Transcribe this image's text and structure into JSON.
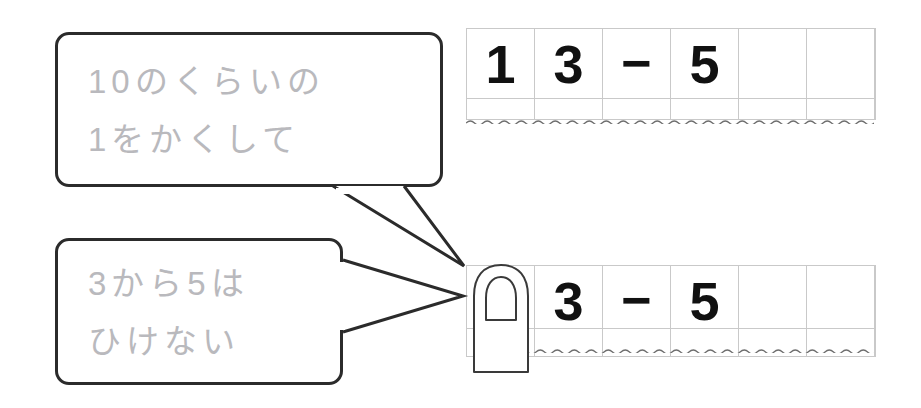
{
  "page": {
    "background_color": "#ffffff"
  },
  "colors": {
    "bubble_border": "#2b2b2b",
    "bubble_text": "#b9b9bd",
    "grid_line": "#c9c9c9",
    "digit": "#111111",
    "finger_outline": "#3a3a3a",
    "wave_line": "#6e6e6e"
  },
  "bubbles": [
    {
      "id": "bubble-one",
      "line1": "10のくらいの",
      "line2": "1をかくして",
      "tail_target": "top-of-bottom-grid"
    },
    {
      "id": "bubble-two",
      "line1": "3から5は",
      "line2": "ひけない",
      "tail_target": "finger"
    }
  ],
  "grids": [
    {
      "id": "grid-top",
      "label": "problem-row-original",
      "cells": [
        "1",
        "3",
        "−",
        "5",
        "",
        ""
      ],
      "cell_count": 6,
      "has_divider": true,
      "has_wave": true
    },
    {
      "id": "grid-bottom",
      "label": "problem-row-covered",
      "cells": [
        "",
        "3",
        "−",
        "5",
        "",
        ""
      ],
      "cell_count": 6,
      "has_divider": true,
      "has_wave": true
    }
  ],
  "finger": {
    "name": "finger-covering-tens-digit",
    "covers_cell_index": 0,
    "covers_value": "1"
  }
}
